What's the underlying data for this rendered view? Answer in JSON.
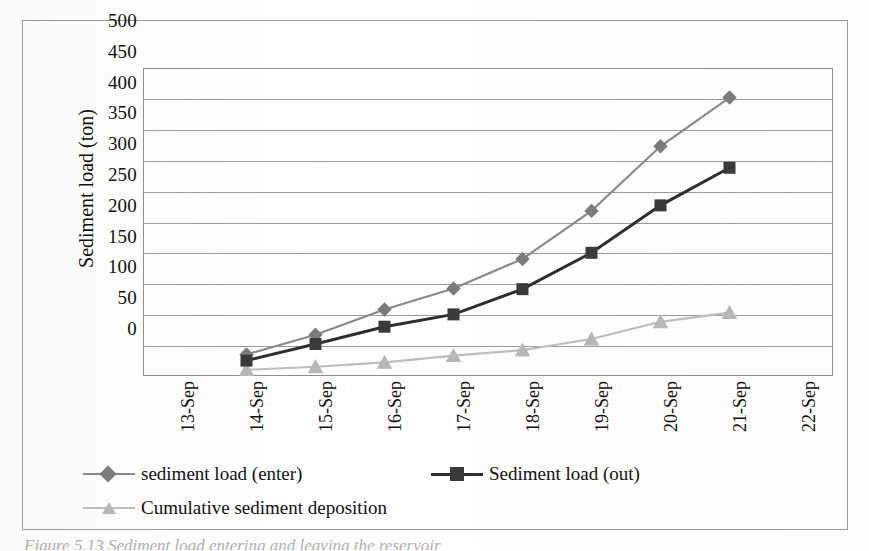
{
  "figure": {
    "caption": "Figure 5.13  Sediment load entering and leaving the reservoir"
  },
  "chart_data": {
    "type": "line",
    "title": "",
    "xlabel": "",
    "ylabel": "Sediment load (ton)",
    "categories": [
      "13-Sep",
      "14-Sep",
      "15-Sep",
      "16-Sep",
      "17-Sep",
      "18-Sep",
      "19-Sep",
      "20-Sep",
      "21-Sep",
      "22-Sep"
    ],
    "ylim": [
      0,
      500
    ],
    "ytick_labels": [
      "0",
      "50",
      "100",
      "150",
      "200",
      "250",
      "300",
      "350",
      "400",
      "450",
      "500"
    ],
    "ytick_values": [
      0,
      50,
      100,
      150,
      200,
      250,
      300,
      350,
      400,
      450,
      500
    ],
    "grid": true,
    "legend_position": "bottom",
    "series": [
      {
        "name": "sediment load (enter)",
        "marker": "diamond",
        "color": "#7b7b7b",
        "line_color": "#8a8a8a",
        "x": [
          "14-Sep",
          "15-Sep",
          "16-Sep",
          "17-Sep",
          "18-Sep",
          "19-Sep",
          "20-Sep",
          "21-Sep"
        ],
        "values": [
          35,
          67,
          108,
          142,
          190,
          268,
          373,
          452
        ]
      },
      {
        "name": "Sediment load (out)",
        "marker": "square",
        "color": "#3a3a3a",
        "line_color": "#2e2e2e",
        "x": [
          "14-Sep",
          "15-Sep",
          "16-Sep",
          "17-Sep",
          "18-Sep",
          "19-Sep",
          "20-Sep",
          "21-Sep"
        ],
        "values": [
          25,
          52,
          80,
          100,
          141,
          200,
          277,
          338
        ]
      },
      {
        "name": "Cumulative sediment deposition",
        "marker": "triangle",
        "color": "#b7b7b7",
        "line_color": "#bdbdbd",
        "x": [
          "14-Sep",
          "15-Sep",
          "16-Sep",
          "17-Sep",
          "18-Sep",
          "19-Sep",
          "20-Sep",
          "21-Sep"
        ],
        "values": [
          10,
          15,
          22,
          33,
          42,
          60,
          88,
          103
        ]
      }
    ]
  },
  "legend": {
    "items": [
      {
        "label": "sediment load (enter)"
      },
      {
        "label": "Sediment load (out)"
      },
      {
        "label": "Cumulative sediment deposition"
      }
    ]
  },
  "colors": {
    "frame": "#9a9a9a",
    "grid": "#9c9c9c",
    "series_enter": "#7b7b7b",
    "series_out": "#2e2e2e",
    "series_deposition": "#bdbdbd"
  }
}
